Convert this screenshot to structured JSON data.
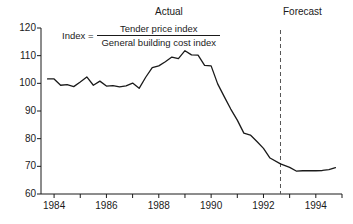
{
  "chart_data": {
    "type": "line",
    "title": "",
    "xlabel": "",
    "ylabel": "",
    "xlim": [
      1983.5,
      1995.0
    ],
    "ylim": [
      60,
      120
    ],
    "grid": false,
    "legend_position": "none",
    "y_ticks": [
      60,
      70,
      80,
      90,
      100,
      110,
      120
    ],
    "y_tick_labels": [
      "60",
      "70",
      "80",
      "90",
      "100",
      "110",
      "120"
    ],
    "x_ticks": [
      1984,
      1985,
      1986,
      1987,
      1988,
      1989,
      1990,
      1991,
      1992,
      1993,
      1994,
      1995
    ],
    "x_tick_labels": [
      "1984",
      "",
      "1986",
      "",
      "1988",
      "",
      "1990",
      "",
      "1992",
      "",
      "1994",
      ""
    ],
    "x_labeled_ticks": [
      1984,
      1986,
      1988,
      1990,
      1992,
      1994
    ],
    "annotations": [
      {
        "name": "actual-label",
        "text": "Actual",
        "x": 1989.0,
        "y": 121.5
      },
      {
        "name": "forecast-label",
        "text": "Forecast",
        "x": 1993.9,
        "y": 121.5
      },
      {
        "name": "forecast-divider",
        "text": "",
        "x": 1992.65,
        "style": "dashed-vertical"
      }
    ],
    "formula": {
      "lhs": "Index  =",
      "numerator": "Tender price index",
      "denominator": "General building cost index"
    },
    "forecast_start_x": 1992.65,
    "series": [
      {
        "name": "Tender price index / General building cost index",
        "color": "#1a1a1a",
        "x": [
          1983.75,
          1984.0,
          1984.25,
          1984.5,
          1984.75,
          1985.0,
          1985.25,
          1985.5,
          1985.75,
          1986.0,
          1986.25,
          1986.5,
          1986.75,
          1987.0,
          1987.25,
          1987.5,
          1987.75,
          1988.0,
          1988.25,
          1988.5,
          1988.75,
          1989.0,
          1989.25,
          1989.5,
          1989.75,
          1990.0,
          1990.25,
          1990.5,
          1990.75,
          1991.0,
          1991.25,
          1991.5,
          1991.75,
          1992.0,
          1992.25,
          1992.65,
          1993.0,
          1993.25,
          1993.5,
          1993.75,
          1994.0,
          1994.25,
          1994.5,
          1994.75
        ],
        "values": [
          101.6,
          101.6,
          99.3,
          99.5,
          98.8,
          100.5,
          102.3,
          99.3,
          100.8,
          99.0,
          99.2,
          98.7,
          99.1,
          100.1,
          98.2,
          102.2,
          105.7,
          106.3,
          107.8,
          109.5,
          108.9,
          111.8,
          110.3,
          110.2,
          106.5,
          106.3,
          99.8,
          95.2,
          90.7,
          86.7,
          82.0,
          81.3,
          79.0,
          76.5,
          73.0,
          70.9,
          69.6,
          68.3,
          68.4,
          68.4,
          68.4,
          68.5,
          68.8,
          69.5
        ]
      }
    ]
  }
}
